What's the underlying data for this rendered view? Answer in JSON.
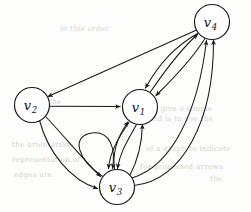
{
  "figure": {
    "background_color": "#fdfdfc",
    "ink_color": "#1a1a1a",
    "width": 251,
    "height": 212
  },
  "nodes": [
    {
      "id": "v1",
      "base": "v",
      "subscript": "1",
      "cx": 140,
      "cy": 107,
      "r": 17.5
    },
    {
      "id": "v2",
      "base": "v",
      "subscript": "2",
      "cx": 32,
      "cy": 105,
      "r": 17.5
    },
    {
      "id": "v3",
      "base": "v",
      "subscript": "3",
      "cx": 117,
      "cy": 187,
      "r": 17.5
    },
    {
      "id": "v4",
      "base": "v",
      "subscript": "4",
      "cx": 212,
      "cy": 22,
      "r": 17.5
    }
  ],
  "edges": [
    {
      "from": "v4",
      "to": "v2",
      "style": "straight",
      "label": "v4-to-v2"
    },
    {
      "from": "v2",
      "to": "v1",
      "style": "straight",
      "label": "v2-to-v1"
    },
    {
      "from": "v2",
      "to": "v3",
      "style": "curve-outer",
      "label": "v2-to-v3-outer"
    },
    {
      "from": "v2",
      "to": "v3",
      "style": "curve-inner",
      "label": "v2-to-v3-inner"
    },
    {
      "from": "v4",
      "to": "v1",
      "style": "curve-left",
      "label": "v4-to-v1-a"
    },
    {
      "from": "v4",
      "to": "v1",
      "style": "curve-right",
      "label": "v4-to-v1-b"
    },
    {
      "from": "v1",
      "to": "v4",
      "style": "curve-middle",
      "label": "v1-to-v4"
    },
    {
      "from": "v3",
      "to": "v1",
      "style": "curve-a",
      "label": "v3-to-v1-a"
    },
    {
      "from": "v3",
      "to": "v1",
      "style": "curve-b",
      "label": "v3-to-v1-b"
    },
    {
      "from": "v1",
      "to": "v3",
      "style": "curve-c",
      "label": "v1-to-v3-a"
    },
    {
      "from": "v1",
      "to": "v3",
      "style": "curve-d",
      "label": "v1-to-v3-b"
    },
    {
      "from": "v3",
      "to": "v3",
      "style": "self-loop-left",
      "label": "v3-self-loop"
    },
    {
      "from": "v3",
      "to": "v4",
      "style": "sweep-outer",
      "label": "v3-to-v4-outer"
    },
    {
      "from": "v3",
      "to": "v4",
      "style": "sweep-inner",
      "label": "v3-to-v4-inner"
    }
  ],
  "bleed_text": [
    {
      "text": "in this order",
      "x": 60,
      "y": 24
    },
    {
      "text": "bility in the",
      "x": 16,
      "y": 97
    },
    {
      "text": "to give a simple",
      "x": 150,
      "y": 104
    },
    {
      "text": "and is to use the",
      "x": 148,
      "y": 114
    },
    {
      "text": "the  orientation",
      "x": 12,
      "y": 140
    },
    {
      "text": "of  a  graph  to  indicate",
      "x": 146,
      "y": 144
    },
    {
      "text": "representation  of",
      "x": 12,
      "y": 155
    },
    {
      "text": "for processed arrows",
      "x": 140,
      "y": 162
    },
    {
      "text": "edges are",
      "x": 14,
      "y": 170
    },
    {
      "text": "the",
      "x": 210,
      "y": 174
    }
  ]
}
